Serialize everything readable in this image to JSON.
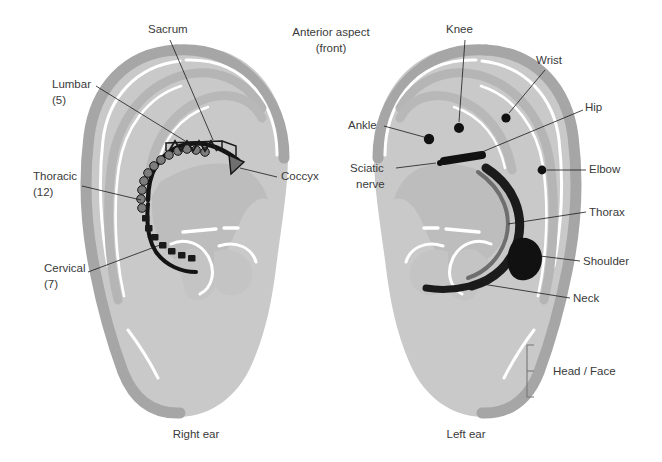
{
  "figure": {
    "header_line1": "Anterior aspect",
    "header_line2": "(front)",
    "caption_left": "Right ear",
    "caption_right": "Left ear",
    "colors": {
      "ear_fill": "#cccccc",
      "ear_ridge": "#a9a9a9",
      "highlight": "#ffffff",
      "marker_dark": "#111111",
      "text": "#3a3a3a",
      "leader": "#1b1b1b",
      "background": "#ffffff"
    }
  },
  "right_ear": {
    "title": "Right ear",
    "description": "Spinal column map projected on the antihelix of the right ear",
    "labels": [
      {
        "id": "sacrum",
        "name": "Sacrum",
        "line1": "Sacrum",
        "line2": "",
        "x": 148,
        "y": 33,
        "anchor": "start"
      },
      {
        "id": "lumbar",
        "name": "Lumbar",
        "line1": "Lumbar",
        "line2": "(5)",
        "x": 52,
        "y": 88,
        "anchor": "start"
      },
      {
        "id": "thoracic",
        "name": "Thoracic",
        "line1": "Thoracic",
        "line2": "(12)",
        "x": 33,
        "y": 180,
        "anchor": "start"
      },
      {
        "id": "cervical",
        "name": "Cervical",
        "line1": "Cervical",
        "line2": "(7)",
        "x": 44,
        "y": 272,
        "anchor": "start"
      },
      {
        "id": "coccyx",
        "name": "Coccyx",
        "line1": "Coccyx",
        "line2": "",
        "x": 281,
        "y": 180,
        "anchor": "start"
      }
    ],
    "segments": [
      {
        "id": "cervical",
        "name": "Cervical (7)",
        "count": 7,
        "style": "small-blocks"
      },
      {
        "id": "thoracic",
        "name": "Thoracic (12)",
        "count": 12,
        "style": "round-beads"
      },
      {
        "id": "lumbar",
        "name": "Lumbar (5)",
        "count": 5,
        "style": "zigzag"
      },
      {
        "id": "sacrum",
        "name": "Sacrum",
        "count": 1,
        "style": "bracket"
      },
      {
        "id": "coccyx",
        "name": "Coccyx",
        "count": 1,
        "style": "triangle"
      }
    ]
  },
  "left_ear": {
    "title": "Left ear",
    "description": "Limb, trunk and head correspondence points on the left ear",
    "labels": [
      {
        "id": "knee",
        "name": "Knee",
        "line1": "Knee",
        "line2": "",
        "x": 446,
        "y": 33,
        "anchor": "start"
      },
      {
        "id": "wrist",
        "name": "Wrist",
        "line1": "Wrist",
        "line2": "",
        "x": 536,
        "y": 64,
        "anchor": "start"
      },
      {
        "id": "hip",
        "name": "Hip",
        "line1": "Hip",
        "line2": "",
        "x": 585,
        "y": 111,
        "anchor": "start"
      },
      {
        "id": "ankle",
        "name": "Ankle",
        "line1": "Ankle",
        "line2": "",
        "x": 348,
        "y": 129,
        "anchor": "start"
      },
      {
        "id": "sciatic",
        "name": "Sciatic nerve",
        "line1": "Sciatic",
        "line2": "nerve",
        "x": 350,
        "y": 172,
        "anchor": "start"
      },
      {
        "id": "elbow",
        "name": "Elbow",
        "line1": "Elbow",
        "line2": "",
        "x": 589,
        "y": 173,
        "anchor": "start"
      },
      {
        "id": "thorax",
        "name": "Thorax",
        "line1": "Thorax",
        "line2": "",
        "x": 589,
        "y": 216,
        "anchor": "start"
      },
      {
        "id": "shoulder",
        "name": "Shoulder",
        "line1": "Shoulder",
        "line2": "",
        "x": 583,
        "y": 265,
        "anchor": "start"
      },
      {
        "id": "neck",
        "name": "Neck",
        "line1": "Neck",
        "line2": "",
        "x": 573,
        "y": 302,
        "anchor": "start"
      },
      {
        "id": "headface",
        "name": "Head / Face",
        "line1": "Head / Face",
        "line2": "",
        "x": 553,
        "y": 375,
        "anchor": "start"
      }
    ],
    "markers": [
      {
        "id": "knee",
        "name": "Knee",
        "shape": "dot",
        "cx": 459,
        "cy": 128,
        "r": 5.0
      },
      {
        "id": "wrist",
        "name": "Wrist",
        "shape": "dot",
        "cx": 506,
        "cy": 118,
        "r": 4.6
      },
      {
        "id": "ankle",
        "name": "Ankle",
        "shape": "dot",
        "cx": 429,
        "cy": 139,
        "r": 5.2
      },
      {
        "id": "sciatic",
        "name": "Sciatic nerve",
        "shape": "dot",
        "cx": 440,
        "cy": 163,
        "r": 3.0
      },
      {
        "id": "elbow",
        "name": "Elbow",
        "shape": "dot",
        "cx": 542,
        "cy": 170,
        "r": 4.4
      },
      {
        "id": "hip",
        "name": "Hip",
        "shape": "bar",
        "cx": 466,
        "cy": 159
      },
      {
        "id": "thorax",
        "name": "Thorax",
        "shape": "arc"
      },
      {
        "id": "shoulder",
        "name": "Shoulder",
        "shape": "blob",
        "cx": 530,
        "cy": 250
      },
      {
        "id": "neck",
        "name": "Neck",
        "shape": "taper"
      },
      {
        "id": "headface",
        "name": "Head / Face",
        "shape": "bracket",
        "y1": 345,
        "y2": 397
      }
    ]
  }
}
